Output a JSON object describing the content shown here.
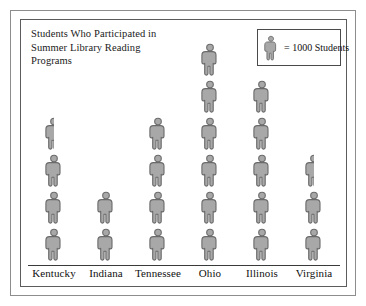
{
  "chart_data": {
    "type": "bar",
    "subtype": "pictograph",
    "title": "Students Who Participated in\nSummer Library Reading\nPrograms",
    "xlabel": "",
    "ylabel": "",
    "unit_value": 1000,
    "unit_label": "= 1000 Students",
    "icon_name": "person-icon",
    "categories": [
      "Kentucky",
      "Indiana",
      "Tennessee",
      "Ohio",
      "Illinois",
      "Virginia"
    ],
    "values": [
      3500,
      2000,
      4000,
      6000,
      5000,
      2500
    ],
    "icon_counts": [
      3.5,
      2,
      4,
      6,
      5,
      2.5
    ],
    "grid": false,
    "legend_position": "top-right",
    "icon_color": "#a8a8a8",
    "icon_outline_color": "#6a6a6a",
    "frame_color": "#5c5c5c"
  },
  "legend": {
    "text": "= 1000 Students",
    "icon": "person-icon"
  },
  "columns": [
    {
      "label": "Kentucky",
      "full": 3,
      "half": true,
      "value": 3500
    },
    {
      "label": "Indiana",
      "full": 2,
      "half": false,
      "value": 2000
    },
    {
      "label": "Tennessee",
      "full": 4,
      "half": false,
      "value": 4000
    },
    {
      "label": "Ohio",
      "full": 6,
      "half": false,
      "value": 6000
    },
    {
      "label": "Illinois",
      "full": 5,
      "half": false,
      "value": 5000
    },
    {
      "label": "Virginia",
      "full": 2,
      "half": true,
      "value": 2500
    }
  ]
}
